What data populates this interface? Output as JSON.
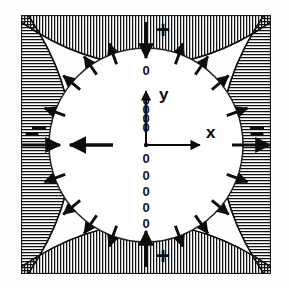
{
  "figure": {
    "frame": {
      "x": 20,
      "y": 14,
      "width": 252,
      "height": 261
    },
    "circle": {
      "cx": 146,
      "cy": 145,
      "r": 97
    },
    "axes": {
      "x_label": "x",
      "y_label": "y",
      "x_label_pos": {
        "x": 209,
        "y": 133
      },
      "y_label_pos": {
        "x": 160,
        "y": 96
      },
      "origin": {
        "x": 146,
        "y": 145
      },
      "x_axis_end": {
        "x": 203,
        "y": 145
      },
      "y_axis_end": {
        "x": 146,
        "y": 88
      }
    },
    "dotted_axis": {
      "glyph": "0",
      "description": "vertical dashed centre line drawn as a column of zero glyphs",
      "upper_zeros_y": [
        75,
        105,
        114,
        123,
        132
      ],
      "lower_zeros_y": [
        163,
        180,
        196,
        212,
        228
      ]
    },
    "sign_markers": [
      {
        "name": "top-plus",
        "symbol": "+",
        "x": 163,
        "y": 31
      },
      {
        "name": "bottom-plus",
        "symbol": "+",
        "x": 163,
        "y": 259
      },
      {
        "name": "left-minus",
        "symbol": "–",
        "x": 32,
        "y": 134
      },
      {
        "name": "right-minus",
        "symbol": "–",
        "x": 257,
        "y": 134
      }
    ],
    "interior_arrow": {
      "name": "interior-left-arrow",
      "direction": "left",
      "from": {
        "x": 112,
        "y": 145
      },
      "to": {
        "x": 67,
        "y": 145
      }
    },
    "edge_arrows": [
      {
        "name": "left-edge-arrow",
        "direction": "right",
        "from": {
          "x": 22,
          "y": 145
        },
        "to": {
          "x": 62,
          "y": 145
        }
      },
      {
        "name": "right-edge-arrow",
        "direction": "right",
        "from": {
          "x": 232,
          "y": 145
        },
        "to": {
          "x": 271,
          "y": 145
        }
      }
    ],
    "cardinal_arrows": [
      {
        "name": "top-inward-arrow",
        "angle_deg": 90,
        "direction": "inward"
      },
      {
        "name": "bottom-inward-arrow",
        "angle_deg": 270,
        "direction": "inward"
      }
    ],
    "rim_arrow_angles_deg": [
      20,
      40,
      55,
      70,
      110,
      125,
      140,
      160,
      200,
      220,
      235,
      250,
      290,
      305,
      320,
      340
    ],
    "hatched_regions": [
      {
        "name": "top-hatch-region",
        "sign": "+",
        "hatch_direction": "vertical"
      },
      {
        "name": "bottom-hatch-region",
        "sign": "+",
        "hatch_direction": "vertical"
      },
      {
        "name": "left-hatch-region",
        "sign": "–",
        "hatch_direction": "horizontal"
      },
      {
        "name": "right-hatch-region",
        "sign": "–",
        "hatch_direction": "horizontal"
      }
    ],
    "colors": {
      "ink": "#0d0d0d",
      "frame": "#1a1a1a",
      "background": "#ffffff",
      "hatch": "#111111"
    }
  }
}
